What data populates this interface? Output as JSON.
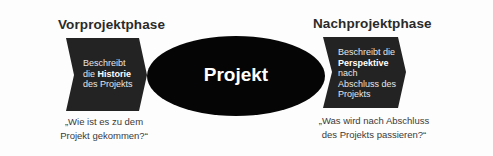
{
  "colors": {
    "background": "#fdfdfd",
    "chevron_fill": "#232323",
    "ellipse_fill": "#050505",
    "title_text": "#2a2a2a",
    "shape_text": "#e6e6e6",
    "question_text": "#3a3a3a"
  },
  "left_phase": {
    "title": "Vorprojektphase",
    "description": {
      "line1": "Beschreibt",
      "line2_prefix": "die ",
      "line2_bold": "Historie",
      "line3": "des Projekts"
    },
    "question_line1": "„Wie ist es zu dem",
    "question_line2": "Projekt gekommen?“"
  },
  "center": {
    "label": "Projekt"
  },
  "right_phase": {
    "title": "Nachprojektphase",
    "description": {
      "line1": "Beschreibt die",
      "line2_bold": "Perspektive",
      "line3": "nach",
      "line4": "Abschluss des",
      "line5": "Projekts"
    },
    "question_line1": "„Was wird nach Abschluss",
    "question_line2": "des Projekts passieren?“"
  }
}
